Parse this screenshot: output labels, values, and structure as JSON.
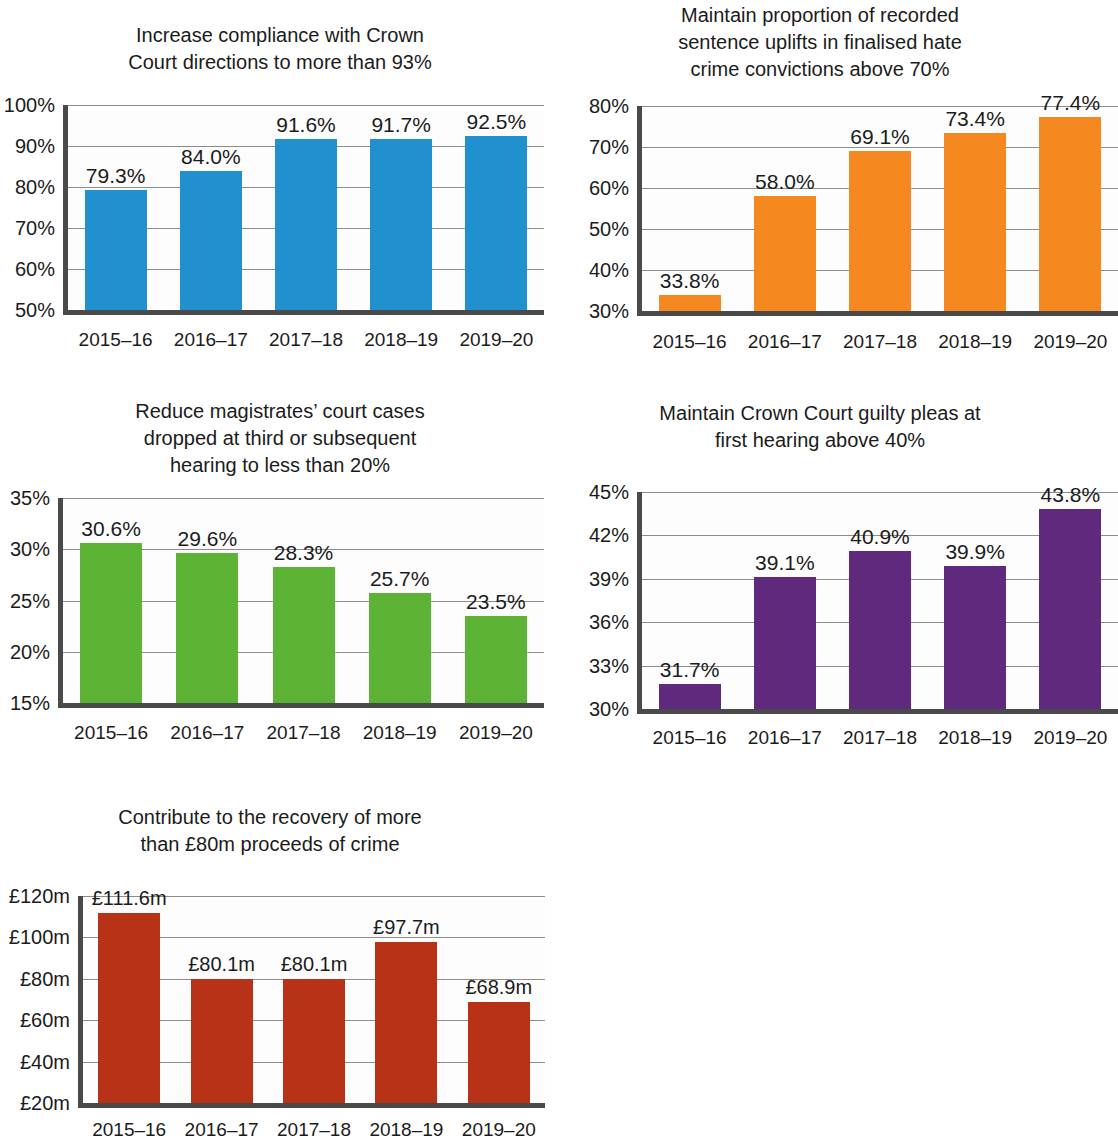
{
  "chart_data": [
    {
      "id": "crown-court-compliance",
      "type": "bar",
      "title": "Increase compliance with Crown\nCourt directions to more than 93%",
      "xlabel": "",
      "ylabel": "",
      "categories": [
        "2015–16",
        "2016–17",
        "2017–18",
        "2018–19",
        "2019–20"
      ],
      "values": [
        79.3,
        84.0,
        91.6,
        91.7,
        92.5
      ],
      "data_labels": [
        "79.3%",
        "84.0%",
        "91.6%",
        "91.7%",
        "92.5%"
      ],
      "ytick_labels": [
        "100%",
        "90%",
        "80%",
        "70%",
        "60%",
        "50%"
      ],
      "yticks": [
        100,
        90,
        80,
        70,
        60,
        50
      ],
      "ylim": [
        50,
        100
      ],
      "color": "#2190cf",
      "grid": true,
      "legend": "none"
    },
    {
      "id": "hate-crime-sentence-uplifts",
      "type": "bar",
      "title": "Maintain proportion of recorded\nsentence uplifts in finalised hate\ncrime convictions above 70%",
      "xlabel": "",
      "ylabel": "",
      "categories": [
        "2015–16",
        "2016–17",
        "2017–18",
        "2018–19",
        "2019–20"
      ],
      "values": [
        33.8,
        58.0,
        69.1,
        73.4,
        77.4
      ],
      "data_labels": [
        "33.8%",
        "58.0%",
        "69.1%",
        "73.4%",
        "77.4%"
      ],
      "ytick_labels": [
        "80%",
        "70%",
        "60%",
        "50%",
        "40%",
        "30%"
      ],
      "yticks": [
        80,
        70,
        60,
        50,
        40,
        30
      ],
      "ylim": [
        30,
        80
      ],
      "color": "#f5881f",
      "grid": true,
      "legend": "none"
    },
    {
      "id": "magistrates-cases-dropped",
      "type": "bar",
      "title": "Reduce magistrates’ court cases\ndropped at third or subsequent\nhearing to less than 20%",
      "xlabel": "",
      "ylabel": "",
      "categories": [
        "2015–16",
        "2016–17",
        "2017–18",
        "2018–19",
        "2019–20"
      ],
      "values": [
        30.6,
        29.6,
        28.3,
        25.7,
        23.5
      ],
      "data_labels": [
        "30.6%",
        "29.6%",
        "28.3%",
        "25.7%",
        "23.5%"
      ],
      "ytick_labels": [
        "35%",
        "30%",
        "25%",
        "20%",
        "15%"
      ],
      "yticks": [
        35,
        30,
        25,
        20,
        15
      ],
      "ylim": [
        15,
        35
      ],
      "color": "#5cb334",
      "grid": true,
      "legend": "none"
    },
    {
      "id": "crown-court-guilty-pleas",
      "type": "bar",
      "title": "Maintain Crown Court guilty pleas at\nfirst hearing above 40%",
      "xlabel": "",
      "ylabel": "",
      "categories": [
        "2015–16",
        "2016–17",
        "2017–18",
        "2018–19",
        "2019–20"
      ],
      "values": [
        31.7,
        39.1,
        40.9,
        39.9,
        43.8
      ],
      "data_labels": [
        "31.7%",
        "39.1%",
        "40.9%",
        "39.9%",
        "43.8%"
      ],
      "ytick_labels": [
        "45%",
        "42%",
        "39%",
        "36%",
        "33%",
        "30%"
      ],
      "yticks": [
        45,
        42,
        39,
        36,
        33,
        30
      ],
      "ylim": [
        30,
        45
      ],
      "color": "#5f2a7e",
      "grid": true,
      "legend": "none"
    },
    {
      "id": "proceeds-of-crime-recovery",
      "type": "bar",
      "title": "Contribute to the recovery of more\nthan £80m proceeds of crime",
      "xlabel": "",
      "ylabel": "",
      "categories": [
        "2015–16",
        "2016–17",
        "2017–18",
        "2018–19",
        "2019–20"
      ],
      "values": [
        111.6,
        80.1,
        80.1,
        97.7,
        68.9
      ],
      "data_labels": [
        "£111.6m",
        "£80.1m",
        "£80.1m",
        "£97.7m",
        "£68.9m"
      ],
      "ytick_labels": [
        "£120m",
        "£100m",
        "£80m",
        "£60m",
        "£40m",
        "£20m"
      ],
      "yticks": [
        120,
        100,
        80,
        60,
        40,
        20
      ],
      "ylim": [
        20,
        120
      ],
      "color": "#b83218",
      "grid": true,
      "legend": "none"
    }
  ]
}
